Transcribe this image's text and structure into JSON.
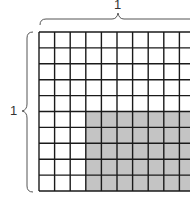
{
  "diagram": {
    "top_label": "1",
    "left_label": "1",
    "grid": {
      "rows": 10,
      "cols": 10,
      "shaded_from_row": 5,
      "shaded_from_col": 3
    },
    "colors": {
      "line": "#1a1a1a",
      "shade": "#c4c4c4",
      "brace": "#555555"
    }
  }
}
